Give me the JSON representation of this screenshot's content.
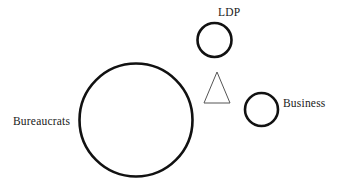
{
  "canvas": {
    "width": 341,
    "height": 191,
    "background": "#ffffff",
    "stroke_color": "#111111",
    "thin_stroke_color": "#555555"
  },
  "diagram": {
    "type": "actor-relationship-diagram",
    "shapes": [
      {
        "id": "bureaucrats",
        "shape": "circle",
        "label": "Bureaucrats",
        "label_position": "left",
        "cx": 136,
        "cy": 120,
        "r": 56.5,
        "stroke": "#111111",
        "stroke_width": 2.6,
        "fill": "none"
      },
      {
        "id": "ldp",
        "shape": "circle",
        "label": "LDP",
        "label_position": "top-right",
        "cx": 214.5,
        "cy": 40,
        "r": 17,
        "stroke": "#111111",
        "stroke_width": 2.6,
        "fill": "none"
      },
      {
        "id": "business",
        "shape": "circle",
        "label": "Business",
        "label_position": "right",
        "cx": 261.5,
        "cy": 109.5,
        "r": 16.5,
        "stroke": "#111111",
        "stroke_width": 2.6,
        "fill": "none"
      },
      {
        "id": "unlabeled-triangle",
        "shape": "triangle",
        "label": "",
        "apex_x": 217,
        "apex_y": 72,
        "base_left_x": 204,
        "base_right_x": 230,
        "base_y": 103,
        "stroke": "#555555",
        "stroke_width": 1,
        "fill": "none"
      }
    ],
    "labels": {
      "bureaucrats": "Bureaucrats",
      "ldp": "LDP",
      "business": "Business"
    }
  }
}
